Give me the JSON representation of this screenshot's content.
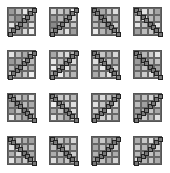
{
  "grid": {
    "rows": 4,
    "cols": 4,
    "tile_positions_x": [
      7,
      49,
      91,
      133
    ],
    "tile_positions_y": [
      7,
      50,
      93,
      136
    ],
    "tiles": [
      {
        "dir": "/",
        "shades": [
          "#9a9a9a",
          "#bcbcbc",
          "#e6e6e6",
          "#c8c8c8",
          "#a8a8a8",
          "#8c8c8c",
          "#d0d0d0",
          "#b4b4b4",
          "#e0e0e0",
          "#c0c0c0",
          "#9c9c9c",
          "#dedede",
          "#bababa",
          "#a0a0a0",
          "#d6d6d6",
          "#f0f0f0"
        ]
      },
      {
        "dir": "/",
        "shades": [
          "#d8d8d8",
          "#c8c8c8",
          "#b8b8b8",
          "#e8e8e8",
          "#9a9a9a",
          "#b2b2b2",
          "#a8a8a8",
          "#d4d4d4",
          "#8a8a8a",
          "#aaaaaa",
          "#bdbdbd",
          "#c8c8c8",
          "#a0a0a0",
          "#c0c0c0",
          "#e2e2e2",
          "#9e9e9e"
        ]
      },
      {
        "dir": "\\",
        "shades": [
          "#9a9a9a",
          "#a8a8a8",
          "#c4c4c4",
          "#dedede",
          "#b4b4b4",
          "#8c8c8c",
          "#bebebe",
          "#a6a6a6",
          "#c0c0c0",
          "#ababab",
          "#9c9c9c",
          "#cccccc",
          "#e8e8e8",
          "#b6b6b6",
          "#a2a2a2",
          "#c4c4c4"
        ]
      },
      {
        "dir": "\\",
        "shades": [
          "#9e9e9e",
          "#e0e0e0",
          "#c8c8c8",
          "#a4a4a4",
          "#d6d6d6",
          "#dadada",
          "#b8b8b8",
          "#b0b0b0",
          "#e4e4e4",
          "#c0c0c0",
          "#d2d2d2",
          "#e0e0e0",
          "#a0a0a0",
          "#bcbcbc",
          "#c6c6c6",
          "#b0b0b0"
        ]
      },
      {
        "dir": "/",
        "shades": [
          "#e2e2e2",
          "#bcbcbc",
          "#aaaaaa",
          "#c6c6c6",
          "#9a9a9a",
          "#a6a6a6",
          "#c8c8c8",
          "#b8b8b8",
          "#b8b8b8",
          "#9e9e9e",
          "#bcbcbc",
          "#aeaeae",
          "#cccccc",
          "#aaaaaa",
          "#c4c4c4",
          "#eeeeee"
        ]
      },
      {
        "dir": "/",
        "shades": [
          "#a8a8a8",
          "#d0d0d0",
          "#dcdcdc",
          "#b4b4b4",
          "#e4e4e4",
          "#bcbcbc",
          "#aaaaaa",
          "#d8d8d8",
          "#ececec",
          "#c8c8c8",
          "#e0e0e0",
          "#bcbcbc",
          "#a6a6a6",
          "#e8e8e8",
          "#c4c4c4",
          "#b6b6b6"
        ]
      },
      {
        "dir": "\\",
        "shades": [
          "#a4a4a4",
          "#c6c6c6",
          "#b0b0b0",
          "#d8d8d8",
          "#dedede",
          "#bebebe",
          "#c4c4c4",
          "#a8a8a8",
          "#b6b6b6",
          "#e6e6e6",
          "#c8c8c8",
          "#d0d0d0",
          "#aaaaaa",
          "#c6c6c6",
          "#e2e2e2",
          "#b6b6b6"
        ]
      },
      {
        "dir": "\\",
        "shades": [
          "#aaaaaa",
          "#b8b8b8",
          "#cccccc",
          "#e6e6e6",
          "#9c9c9c",
          "#a4a4a4",
          "#b6b6b6",
          "#c2c2c2",
          "#a8a8a8",
          "#c0c0c0",
          "#aaaaaa",
          "#a2a2a2",
          "#b0b0b0",
          "#cccccc",
          "#dadada",
          "#b8b8b8"
        ]
      },
      {
        "dir": "\\",
        "shades": [
          "#a4a4a4",
          "#c4c4c4",
          "#aeaeae",
          "#e0e0e0",
          "#a6a6a6",
          "#9c9c9c",
          "#b8b8b8",
          "#aaaaaa",
          "#9c9c9c",
          "#c0c0c0",
          "#bcbcbc",
          "#c6c6c6",
          "#e6e6e6",
          "#b8b8b8",
          "#a2a2a2",
          "#c0c0c0"
        ]
      },
      {
        "dir": "\\",
        "shades": [
          "#aaaaaa",
          "#c8c8c8",
          "#d0d0d0",
          "#b8b8b8",
          "#ececec",
          "#b0b0b0",
          "#cccccc",
          "#e0e0e0",
          "#a8a8a8",
          "#c4c4c4",
          "#b6b6b6",
          "#d8d8d8",
          "#e2e2e2",
          "#bcbcbc",
          "#a4a4a4",
          "#c8c8c8"
        ]
      },
      {
        "dir": "/",
        "shades": [
          "#b2b2b2",
          "#dadada",
          "#c6c6c6",
          "#aaaaaa",
          "#e0e0e0",
          "#c2c2c2",
          "#b0b0b0",
          "#d6d6d6",
          "#c8c8c8",
          "#b0b0b0",
          "#e6e6e6",
          "#bcbcbc",
          "#a4a4a4",
          "#cccccc",
          "#d8d8d8",
          "#b2b2b2"
        ]
      },
      {
        "dir": "/",
        "shades": [
          "#a8a8a8",
          "#c0c0c0",
          "#d2d2d2",
          "#b4b4b4",
          "#bcbcbc",
          "#a0a0a0",
          "#aaaaaa",
          "#c8c8c8",
          "#9e9e9e",
          "#b4b4b4",
          "#c2c2c2",
          "#a6a6a6",
          "#a8a8a8",
          "#c4c4c4",
          "#b2b2b2",
          "#dedede"
        ]
      },
      {
        "dir": "\\",
        "shades": [
          "#a6a6a6",
          "#c8c8c8",
          "#aeaeae",
          "#a2a2a2",
          "#e0e0e0",
          "#cccccc",
          "#b6b6b6",
          "#c4c4c4",
          "#b0b0b0",
          "#dadada",
          "#c4c4c4",
          "#aaaaaa",
          "#e2e2e2",
          "#b8b8b8",
          "#cacaca",
          "#b4b4b4"
        ]
      },
      {
        "dir": "\\",
        "shades": [
          "#a6a6a6",
          "#c2c2c2",
          "#b2b2b2",
          "#d6d6d6",
          "#bcbcbc",
          "#a4a4a4",
          "#c6c6c6",
          "#b8b8b8",
          "#acacac",
          "#bebebe",
          "#a8a8a8",
          "#cccccc",
          "#dcdcdc",
          "#b4b4b4",
          "#c4c4c4",
          "#aaaaaa"
        ]
      },
      {
        "dir": "/",
        "shades": [
          "#b6b6b6",
          "#c8c8c8",
          "#aaaaaa",
          "#a6a6a6",
          "#a4a4a4",
          "#bebebe",
          "#b4b4b4",
          "#c8c8c8",
          "#b0b0b0",
          "#a8a8a8",
          "#c2c2c2",
          "#acacac",
          "#a0a0a0",
          "#bcbcbc",
          "#aaaaaa",
          "#d4d4d4"
        ]
      },
      {
        "dir": "/",
        "shades": [
          "#acacac",
          "#c8c8c8",
          "#e2e2e2",
          "#aaaaaa",
          "#cccccc",
          "#b6b6b6",
          "#aeaeae",
          "#d2d2d2",
          "#b8b8b8",
          "#a8a8a8",
          "#c4c4c4",
          "#b6b6b6",
          "#e0e0e0",
          "#b4b4b4",
          "#c6c6c6",
          "#aaaaaa"
        ]
      }
    ]
  }
}
